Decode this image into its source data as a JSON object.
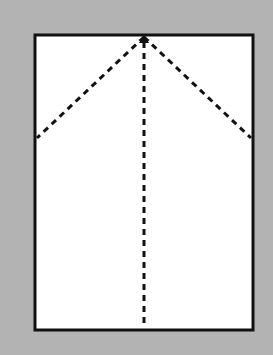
{
  "diagram": {
    "type": "origami-fold-diagram",
    "background_color": "#b3b3b3",
    "paper": {
      "color": "#ffffff",
      "border_color": "#111111",
      "x": 35,
      "y": 35,
      "width": 218,
      "height": 295
    },
    "fold_lines": [
      {
        "name": "left-diagonal-valley-fold",
        "style": "dashed",
        "from": [
          144,
          37
        ],
        "to": [
          37,
          138
        ]
      },
      {
        "name": "right-diagonal-valley-fold",
        "style": "dashed",
        "from": [
          144,
          37
        ],
        "to": [
          251,
          138
        ]
      },
      {
        "name": "vertical-center-valley-fold",
        "style": "dashed",
        "from": [
          144,
          40
        ],
        "to": [
          144,
          328
        ]
      }
    ],
    "apex_marker": "arrowhead-up"
  }
}
